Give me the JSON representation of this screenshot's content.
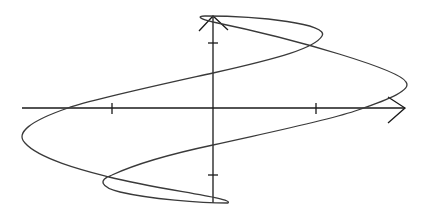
{
  "figure": {
    "background": "#ffffff",
    "axis_color": "#1a1a1a",
    "curve_color": "#3a3a3a",
    "axes": {
      "origin": [
        213,
        108
      ],
      "x_axis": {
        "from": [
          22,
          108
        ],
        "to": [
          405,
          108
        ],
        "arrow": true,
        "ticks": [
          112,
          316
        ]
      },
      "y_axis": {
        "from": [
          213,
          203
        ],
        "to": [
          213,
          16
        ],
        "arrow": true,
        "ticks": [
          43,
          175
        ]
      }
    },
    "curve_path": "M 406 82 C 400 70, 300 40, 213 22 C 200 19, 196 16, 205 16 C 260 16, 330 24, 322 36 C 315 48, 280 58, 213 73 C 150 87, 90 100, 68 108 C 30 121, 15 133, 25 143 C 40 160, 90 172, 109 177 C 160 190, 235 198, 228 203 C 200 203, 150 199, 120 192 C 100 187, 98 180, 112 175 C 140 162, 180 152, 213 145 C 280 130, 330 120, 358 110 C 390 99, 412 90, 406 82 Z"
  }
}
